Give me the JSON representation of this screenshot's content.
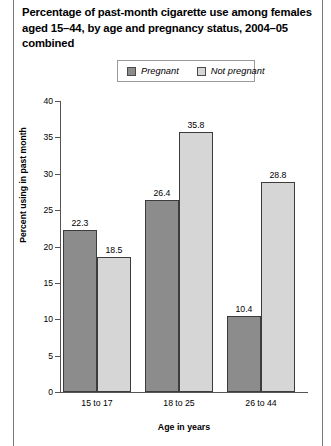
{
  "title": "Percentage of past-month cigarette use among females aged 15–44, by age and pregnancy status, 2004–05 combined",
  "legend": {
    "entries": [
      {
        "label": "Pregnant",
        "color": "#8c8c8c"
      },
      {
        "label": "Not pregnant",
        "color": "#d6d6d6"
      }
    ]
  },
  "chart_data": {
    "type": "bar",
    "title": "Percentage of past-month cigarette use among females aged 15–44, by age and pregnancy status, 2004–05 combined",
    "categories": [
      "15 to 17",
      "18 to 25",
      "26 to 44"
    ],
    "series": [
      {
        "name": "Pregnant",
        "values": [
          22.3,
          26.4,
          10.4
        ],
        "color": "#8c8c8c"
      },
      {
        "name": "Not pregnant",
        "values": [
          18.5,
          35.8,
          28.8
        ],
        "color": "#d6d6d6"
      }
    ],
    "xlabel": "Age in years",
    "ylabel": "Percent using in past month",
    "ylim": [
      0,
      40
    ],
    "yticks": [
      0,
      5,
      10,
      15,
      20,
      25,
      30,
      35,
      40
    ],
    "ytick_labels": [
      "0",
      "5",
      "10",
      "15",
      "20",
      "25",
      "30",
      "35",
      "40"
    ],
    "grid": false,
    "legend_position": "top-center",
    "value_labels": [
      "22.3",
      "18.5",
      "26.4",
      "35.8",
      "10.4",
      "28.8"
    ]
  }
}
